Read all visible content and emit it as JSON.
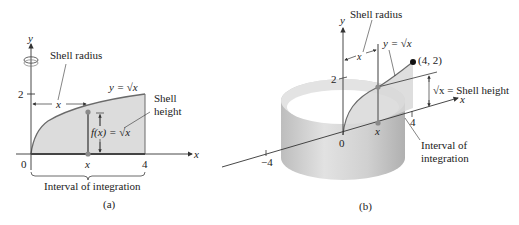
{
  "panel_a": {
    "caption": "(a)",
    "axis_x": "x",
    "axis_y": "y",
    "tick_y_2": "2",
    "tick_origin": "0",
    "tick_x": "x",
    "tick_x_4": "4",
    "shell_radius_label": "Shell radius",
    "radius_var": "x",
    "curve_label": "y = √x",
    "shell_height_label_1": "Shell",
    "shell_height_label_2": "height",
    "fx_label": "f(x) = √x",
    "interval_label": "Interval of integration"
  },
  "panel_b": {
    "caption": "(b)",
    "axis_x": "x",
    "axis_y": "y",
    "tick_y_2": "2",
    "tick_origin": "0",
    "tick_x": "x",
    "tick_x_4": "4",
    "tick_x_neg4": "−4",
    "shell_radius_label": "Shell radius",
    "radius_var": "x",
    "curve_label": "y = √x",
    "point_label": "(4, 2)",
    "shell_height_label": "√x = Shell height",
    "interval_label_1": "Interval of",
    "interval_label_2": "integration"
  },
  "colors": {
    "fill_region": "#d9d9d9",
    "curve": "#6a6a6a",
    "cylinder_light": "#e6e6e6",
    "cylinder_dark": "#b5b5b5",
    "point": "#111111",
    "marker": "#8a8a8a"
  }
}
